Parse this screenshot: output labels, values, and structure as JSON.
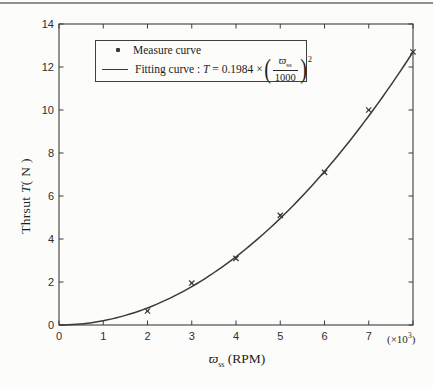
{
  "axes": {
    "y_title_prefix": "Thrsut ",
    "y_title_var": "T",
    "y_title_suffix": "( N )",
    "x_title_symbol": "ϖ",
    "x_title_sub": "ss",
    "x_title_suffix": " (RPM)",
    "x_scale_prefix": "(×10",
    "x_scale_exp": "3",
    "x_scale_suffix": ")"
  },
  "legend": {
    "measure_label": "Measure curve",
    "fitting_prefix": "Fitting curve : ",
    "fitting_var": "T",
    "fitting_mid": " = 0.1984 ×",
    "frac_num_symbol": "ϖ",
    "frac_num_sub": "ss",
    "frac_den": "1000",
    "exponent": "2"
  },
  "colors": {
    "ink": "#3a3a3a",
    "axis": "#3d3d3d",
    "text": "#1d1d1d",
    "paper": "#fcfcfa",
    "top_rule": "#919191"
  },
  "chart_data": {
    "type": "scatter",
    "title": "",
    "xlabel": "ϖss (RPM), units of ×10³",
    "ylabel": "Thrsut T( N )",
    "xlim": [
      0,
      8
    ],
    "ylim": [
      0,
      14
    ],
    "xticks": [
      0,
      1,
      2,
      3,
      4,
      5,
      6,
      7,
      8
    ],
    "yticks": [
      0,
      2,
      4,
      6,
      8,
      10,
      12,
      14
    ],
    "xtick_labels": [
      "0",
      "1",
      "2",
      "3",
      "4",
      "5",
      "6",
      "7"
    ],
    "ytick_labels": [
      "0",
      "2",
      "4",
      "6",
      "8",
      "10",
      "12",
      "14"
    ],
    "grid": false,
    "legend_position": "top-left",
    "series": [
      {
        "name": "Measure curve",
        "type": "scatter",
        "marker": "x",
        "x": [
          2,
          3,
          4,
          5,
          6,
          7,
          8
        ],
        "y": [
          0.65,
          1.95,
          3.1,
          5.1,
          7.1,
          10.0,
          12.7
        ]
      },
      {
        "name": "Fitting curve",
        "type": "line",
        "formula": "T = 0.1984 × (ϖss/1000)²",
        "coefficient": 0.1984,
        "x_range": [
          0,
          8
        ]
      }
    ]
  }
}
